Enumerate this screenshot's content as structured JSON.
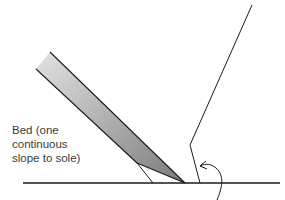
{
  "diagram": {
    "type": "plane blade bed cross-section sketch",
    "label": {
      "lines": [
        "Bed (one",
        "continuous",
        "slope to sole)"
      ]
    },
    "colors": {
      "ink": "#1a1a1a",
      "blade_fill_dark": "#8c8c8c",
      "blade_fill_light": "#d9d9d9",
      "background": "#ffffff"
    }
  }
}
